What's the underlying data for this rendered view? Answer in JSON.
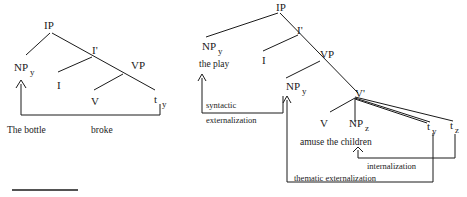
{
  "left_tree": {
    "nodes": {
      "ip": "IP",
      "np": "NP",
      "np_sub": "y",
      "i_bar": "I'",
      "i": "I",
      "vp": "VP",
      "v": "V",
      "t": "t",
      "t_sub": "y"
    },
    "words": {
      "subject": "The bottle",
      "verb": "broke"
    }
  },
  "right_tree": {
    "nodes": {
      "ip": "IP",
      "np_top": "NP",
      "np_top_sub": "y",
      "i_bar": "I'",
      "i": "I",
      "vp": "VP",
      "np_mid": "NP",
      "np_mid_sub": "y",
      "v_bar": "V'",
      "v": "V",
      "np_z": "NP",
      "np_z_sub": "z",
      "t_y": "t",
      "t_y_sub": "y",
      "t_z": "t",
      "t_z_sub": "z"
    },
    "words": {
      "subject": "the play",
      "object": "amuse  the children"
    },
    "arrows": {
      "syntactic_line1": "syntactic",
      "syntactic_line2": "externalization",
      "internalization": "internalization",
      "thematic": "thematic externalization"
    }
  },
  "colors": {
    "ink": "#1a1a1a",
    "background": "#ffffff"
  }
}
